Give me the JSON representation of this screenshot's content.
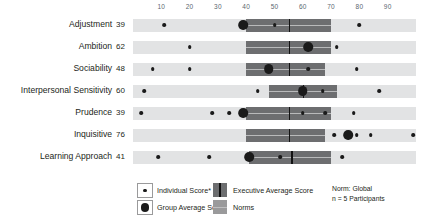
{
  "chart_data": {
    "type": "bar",
    "title": "",
    "xlabel": "",
    "ylabel": "",
    "xlim": [
      0,
      100
    ],
    "grid": false,
    "legend_position": "bottom",
    "axis_ticks": [
      10,
      20,
      30,
      40,
      50,
      60,
      70,
      80,
      90
    ],
    "categories": [
      "Adjustment",
      "Ambition",
      "Sociability",
      "Interpersonal Sensitivity",
      "Prudence",
      "Inquisitive",
      "Learning Approach"
    ],
    "group_average_scores": [
      39,
      62,
      48,
      60,
      39,
      76,
      41
    ],
    "rows": [
      {
        "label": "Adjustment",
        "score": "39",
        "group_average": 39,
        "norms_range": [
          40,
          70
        ],
        "executive_range": [
          40,
          70
        ],
        "executive_average": 55,
        "individual_scores": [
          11,
          50,
          80
        ]
      },
      {
        "label": "Ambition",
        "score": "62",
        "group_average": 62,
        "norms_range": [
          40,
          70
        ],
        "executive_range": [
          40,
          70
        ],
        "executive_average": 55,
        "individual_scores": [
          20,
          72
        ]
      },
      {
        "label": "Sociability",
        "score": "48",
        "group_average": 48,
        "norms_range": [
          40,
          68
        ],
        "executive_range": [
          40,
          68
        ],
        "executive_average": 55,
        "individual_scores": [
          7,
          20,
          62,
          79
        ]
      },
      {
        "label": "Interpersonal Sensitivity",
        "score": "60",
        "group_average": 60,
        "norms_range": [
          48,
          72
        ],
        "executive_range": [
          48,
          72
        ],
        "executive_average": 60,
        "individual_scores": [
          4,
          44,
          67,
          87
        ]
      },
      {
        "label": "Prudence",
        "score": "39",
        "group_average": 39,
        "norms_range": [
          40,
          70
        ],
        "executive_range": [
          40,
          70
        ],
        "executive_average": 55,
        "individual_scores": [
          3,
          28,
          34,
          60,
          68,
          78
        ]
      },
      {
        "label": "Inquisitive",
        "score": "76",
        "group_average": 76,
        "norms_range": [
          40,
          68
        ],
        "executive_range": [
          40,
          68
        ],
        "executive_average": 55,
        "individual_scores": [
          71,
          79,
          84,
          99
        ]
      },
      {
        "label": "Learning Approach",
        "score": "41",
        "group_average": 41,
        "norms_range": [
          41,
          70
        ],
        "executive_range": [
          41,
          70
        ],
        "executive_average": 56,
        "individual_scores": [
          9,
          27,
          52,
          74
        ]
      }
    ],
    "legend": [
      {
        "key": "individual-score",
        "label": "Individual Score*",
        "swatch": "small-dot"
      },
      {
        "key": "group-average-score",
        "label": "Group Average Score",
        "swatch": "large-dot"
      },
      {
        "key": "executive-average-score",
        "label": "Executive Average Score",
        "swatch": "exec-band"
      },
      {
        "key": "norms",
        "label": "Norms",
        "swatch": "norms-band"
      }
    ],
    "norm_note": {
      "line1": "Norm: Global",
      "line2": "n = 5 Participants"
    },
    "colors": {
      "track": "#e2e3e4",
      "norms": "#9a9a9b",
      "executive": "#6d6e70",
      "median_line": "#121212",
      "dot": "#1a1a1a",
      "axis_text": "#5b6770",
      "label_text": "#231f20"
    }
  }
}
